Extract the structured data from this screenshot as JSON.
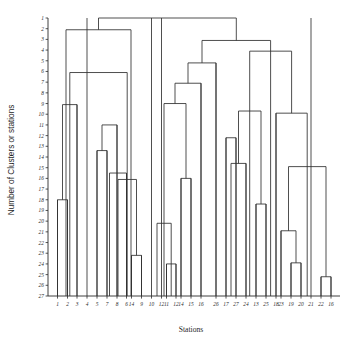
{
  "chart_data": {
    "type": "dendrogram",
    "title": "",
    "xlabel": "Stations",
    "ylabel": "Number of Clusters or stations",
    "ylim": [
      1,
      27
    ],
    "grid": false,
    "legend": "none",
    "y_ticks": [
      1,
      2,
      3,
      4,
      5,
      6,
      7,
      8,
      9,
      10,
      11,
      12,
      13,
      14,
      15,
      16,
      17,
      18,
      19,
      20,
      21,
      22,
      23,
      24,
      25,
      26,
      27
    ],
    "y_tick_labels": [
      "1",
      "2",
      "3",
      "4",
      "5",
      "6",
      "7",
      "8",
      "9",
      "10",
      "11",
      "12",
      "13",
      "14",
      "15",
      "16",
      "17",
      "18",
      "19",
      "20",
      "21",
      "22",
      "23",
      "24",
      "25",
      "26",
      "27"
    ],
    "leaf_order": [
      "1",
      "2",
      "3",
      "4",
      "5",
      "7",
      "8",
      "6",
      "14",
      "9",
      "10",
      "12",
      "11",
      "12b",
      "14b",
      "15",
      "16",
      "26",
      "17",
      "27",
      "24",
      "13",
      "25",
      "18",
      "23",
      "19",
      "20",
      "21",
      "22",
      "16b"
    ],
    "categories": [
      "1",
      "2",
      "3",
      "4",
      "5",
      "7",
      "8",
      "6",
      "14",
      "9",
      "10",
      "12",
      "11",
      "12",
      "14",
      "15",
      "16",
      "26",
      "17",
      "27",
      "24",
      "13",
      "25",
      "18",
      "23",
      "19",
      "20",
      "21",
      "22",
      "16"
    ],
    "x_tick_labels": [
      "1",
      "2",
      "3",
      "4",
      "5",
      "7",
      "8",
      "6",
      "14",
      "9",
      "10",
      "12",
      "11",
      "12",
      "14",
      "15",
      "16",
      "26",
      "17",
      "27",
      "24",
      "13",
      "25",
      "18",
      "23",
      "19",
      "20",
      "21",
      "22",
      "16"
    ],
    "note": "Hierarchical clustering dendrogram; y axis counts clusters/stations from 1 (top, fully merged) to 27 (bottom, singletons).",
    "merges": [
      {
        "id": "m1",
        "height": 18,
        "x1": 57.5,
        "x2": 67.5,
        "label": "merge of leaves 1 and 2"
      },
      {
        "id": "m2",
        "height": 9.1,
        "x1": 62.5,
        "x2": 77.0,
        "label": "merge with leaf 3"
      },
      {
        "id": "m3",
        "height": 13.4,
        "x1": 97.0,
        "x2": 107.0,
        "label": "merge of leaves 5 and 7"
      },
      {
        "id": "m4",
        "height": 11.0,
        "x1": 102.0,
        "x2": 117.0,
        "label": "merge with leaf 8"
      },
      {
        "id": "m5",
        "height": 15.5,
        "x1": 109.5,
        "x2": 126.5,
        "label": "merge with leaf 6"
      },
      {
        "id": "m6",
        "height": 23.2,
        "x1": 131.5,
        "x2": 141.5,
        "label": "merge of leaves 9 and 10"
      },
      {
        "id": "m7",
        "height": 16.1,
        "x1": 118.0,
        "x2": 136.5,
        "label": "merge of cluster and pair"
      },
      {
        "id": "m8",
        "height": 6.1,
        "x1": 69.8,
        "x2": 127.2,
        "label": "left block merge"
      },
      {
        "id": "m9",
        "height": 2.1,
        "x1": 66.0,
        "x2": 131.0,
        "label": "left top merge"
      },
      {
        "id": "m10",
        "height": 24.0,
        "x1": 166.5,
        "x2": 176.0,
        "label": "merge of leaves 12 and 11"
      },
      {
        "id": "m11",
        "height": 20.2,
        "x1": 157.0,
        "x2": 171.2,
        "label": "merge with leaf 12"
      },
      {
        "id": "m12",
        "height": 16.0,
        "x1": 181.0,
        "x2": 191.0,
        "label": "merge of leaves 14 and 15"
      },
      {
        "id": "m13",
        "height": 9.0,
        "x1": 164.0,
        "x2": 186.0,
        "label": "merge of clusters"
      },
      {
        "id": "m14",
        "height": 7.1,
        "x1": 175.0,
        "x2": 201.0,
        "label": "merge with leaf 16"
      },
      {
        "id": "m15",
        "height": 5.2,
        "x1": 188.0,
        "x2": 216.0,
        "label": "merge with leaf 26"
      },
      {
        "id": "m16",
        "height": 12.2,
        "x1": 226.0,
        "x2": 236.0,
        "label": "merge of leaves 24 and 13"
      },
      {
        "id": "m17",
        "height": 14.6,
        "x1": 231.0,
        "x2": 246.0,
        "label": "merge with leaf 25"
      },
      {
        "id": "m18",
        "height": 18.4,
        "x1": 256.0,
        "x2": 266.0,
        "label": "merge of leaves 23 and 19"
      },
      {
        "id": "m19",
        "height": 9.7,
        "x1": 238.5,
        "x2": 261.0,
        "label": "merge of right-mid clusters"
      },
      {
        "id": "m20",
        "height": 23.9,
        "x1": 291.0,
        "x2": 301.0,
        "label": "merge of leaves 21 and 22"
      },
      {
        "id": "m21",
        "height": 20.9,
        "x1": 281.0,
        "x2": 296.0,
        "label": "merge with leaf 20"
      },
      {
        "id": "m22",
        "height": 25.2,
        "x1": 321.0,
        "x2": 331.0,
        "label": "merge of far right pair"
      },
      {
        "id": "m23",
        "height": 14.9,
        "x1": 288.5,
        "x2": 326.0,
        "label": "merge with far right pair"
      },
      {
        "id": "m24",
        "height": 9.9,
        "x1": 276.0,
        "x2": 307.2,
        "label": "right block merge"
      },
      {
        "id": "m25",
        "height": 4.1,
        "x1": 249.7,
        "x2": 291.6,
        "label": "right upper merge"
      },
      {
        "id": "m26",
        "height": 3.1,
        "x1": 202.0,
        "x2": 270.6,
        "label": "right top merge"
      },
      {
        "id": "m27",
        "height": 1.0,
        "x1": 98.5,
        "x2": 236.3,
        "label": "root merge"
      }
    ]
  },
  "plot": {
    "x_axis_start": 48,
    "x_axis_end": 340,
    "y_axis_top": 18,
    "y_axis_bottom": 296,
    "leaf_positions": [
      57.5,
      67.5,
      77.0,
      87.0,
      97.0,
      107.0,
      117.0,
      126.5,
      131.5,
      141.5,
      151.5,
      161.5,
      166.5,
      176.0,
      181.0,
      191.0,
      201.0,
      216.0,
      226.0,
      236.0,
      246.0,
      256.0,
      266.0,
      276.0,
      281.0,
      291.0,
      301.0,
      311.0,
      321.0,
      331.0
    ]
  }
}
